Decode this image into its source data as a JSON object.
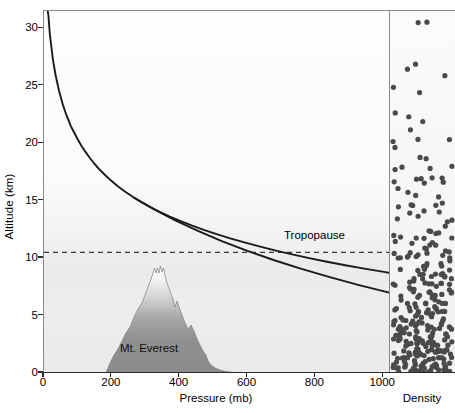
{
  "chart_data": {
    "type": "line",
    "title": "",
    "xlabel": "Pressure (mb)",
    "ylabel": "Altitude (km)",
    "xlim": [
      0,
      1020
    ],
    "ylim": [
      0,
      31.5
    ],
    "xticks": [
      0,
      200,
      400,
      600,
      800,
      1000
    ],
    "yticks": [
      0,
      5,
      10,
      15,
      20,
      25,
      30
    ],
    "grid": false,
    "legend": "none",
    "series": [
      {
        "name": "Atmospheric pressure",
        "x": [
          1013,
          900,
          795,
          700,
          616,
          540,
          472,
          411,
          356,
          308,
          265,
          226,
          193,
          165,
          141,
          121,
          103,
          88,
          75,
          64,
          55,
          47,
          40,
          34,
          29,
          25,
          21,
          18,
          15,
          13,
          11
        ],
        "y": [
          0,
          1,
          2,
          3,
          4,
          5,
          6,
          7,
          8,
          9,
          10,
          11,
          12,
          13,
          14,
          15,
          16,
          17,
          18,
          19,
          20,
          21,
          22,
          23,
          24,
          25,
          26,
          27,
          28,
          29,
          30
        ]
      }
    ],
    "annotations": [
      {
        "name": "tropopause",
        "label": "Tropopause",
        "type": "hline",
        "y": 10.5,
        "style": "dashed"
      },
      {
        "name": "mt-everest",
        "label": "Mt. Everest",
        "type": "region",
        "peak_y": 8.85,
        "base_x_range": [
          180,
          480
        ]
      }
    ],
    "side_panel": {
      "label": "Density",
      "description": "Dot density representing air molecule concentration, increasing toward lower altitudes"
    }
  },
  "axes": {
    "y_label": "Altitude (km)",
    "x_label": "Pressure (mb)",
    "y_ticks": [
      "0",
      "5",
      "10",
      "15",
      "20",
      "25",
      "30"
    ],
    "x_ticks": [
      "0",
      "200",
      "400",
      "600",
      "800",
      "1000"
    ]
  },
  "labels": {
    "tropopause": "Tropopause",
    "everest": "Mt. Everest",
    "density": "Density"
  },
  "colors": {
    "curve": "#1a1a1a",
    "tropopause_line": "#3a3a3a",
    "mountain_base": "#8d8d8d",
    "mountain_peak": "#ffffff",
    "dot": "#4a4a4a",
    "axis": "#2b2b2b",
    "panel_border": "#8a8a8a"
  }
}
